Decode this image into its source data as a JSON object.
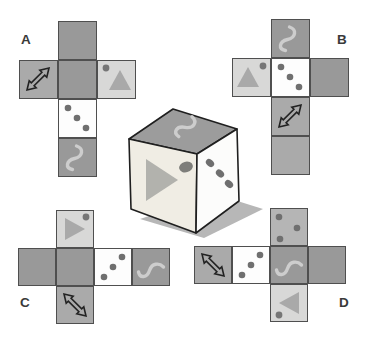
{
  "labels": {
    "option_a": "A",
    "option_b": "B",
    "option_c": "C",
    "option_d": "D"
  },
  "colors": {
    "background": "#ffffff",
    "border": "#4f4f4f",
    "dark": "#999999",
    "medium": "#aaaaaa",
    "light": "#d8d8d7",
    "lighter": "#b5b5b5",
    "white": "#fdfdfd",
    "dot": "#6f6f6f",
    "triangle": "#a9a9a9",
    "triangle_dot": "#767676",
    "squiggle": "#cdcdcd",
    "arrow_stroke": "#222222",
    "label_text": "#3a3a3a",
    "cube_top": "#9c9c9c",
    "cube_front": "#f0ede4",
    "cube_right": "#fcfcfb",
    "cube_stroke": "#1f1f1f",
    "cube_triangle": "#b2b2ad",
    "cube_front_dot": "#7e7e7a",
    "cube_right_dot": "#6f6f6f",
    "shadow": "#b7b7b7"
  },
  "nets": [
    {
      "id": "A",
      "label": "A",
      "label_pos": [
        21,
        33
      ],
      "origin": [
        19,
        21
      ],
      "cell": 39,
      "squares": [
        {
          "pos": [
            1,
            0
          ],
          "bg": "dark",
          "icon": "blank"
        },
        {
          "pos": [
            0,
            1
          ],
          "bg": "medium",
          "icon": "double-arrow-icon",
          "dir": "ne"
        },
        {
          "pos": [
            1,
            1
          ],
          "bg": "dark",
          "icon": "blank"
        },
        {
          "pos": [
            2,
            1
          ],
          "bg": "light",
          "icon": "triangle-icon",
          "tri": [
            [
              12,
              30
            ],
            [
              34,
              30
            ],
            [
              23,
              10
            ]
          ],
          "dot": [
            9,
            8
          ]
        },
        {
          "pos": [
            1,
            2
          ],
          "bg": "white",
          "icon": "three-dots-icon",
          "dots": [
            [
              10,
              9
            ],
            [
              19,
              19
            ],
            [
              28,
              29
            ]
          ]
        },
        {
          "pos": [
            1,
            3
          ],
          "bg": "dark",
          "icon": "s-curve-icon",
          "dir": "v"
        }
      ]
    },
    {
      "id": "B",
      "label": "B",
      "label_pos": [
        337,
        33
      ],
      "origin": [
        232,
        19
      ],
      "cell": 39,
      "squares": [
        {
          "pos": [
            1,
            0
          ],
          "bg": "dark",
          "icon": "s-curve-icon",
          "dir": "v"
        },
        {
          "pos": [
            0,
            1
          ],
          "bg": "light",
          "icon": "triangle-icon",
          "tri": [
            [
              5,
              29
            ],
            [
              27,
              29
            ],
            [
              16,
              9
            ]
          ],
          "dot": [
            31,
            8
          ]
        },
        {
          "pos": [
            1,
            1
          ],
          "bg": "white",
          "icon": "three-dots-icon",
          "dots": [
            [
              10,
              9
            ],
            [
              19,
              19
            ],
            [
              28,
              29
            ]
          ]
        },
        {
          "pos": [
            2,
            1
          ],
          "bg": "dark",
          "icon": "blank"
        },
        {
          "pos": [
            1,
            2
          ],
          "bg": "medium",
          "icon": "double-arrow-icon",
          "dir": "ne"
        },
        {
          "pos": [
            1,
            3
          ],
          "bg": "medium",
          "icon": "blank"
        }
      ]
    },
    {
      "id": "C",
      "label": "C",
      "label_pos": [
        20,
        296
      ],
      "origin": [
        18,
        210
      ],
      "cell": 38,
      "squares": [
        {
          "pos": [
            1,
            0
          ],
          "bg": "light",
          "icon": "triangle-icon",
          "tri": [
            [
              9,
              8
            ],
            [
              9,
              30
            ],
            [
              29,
              19
            ]
          ],
          "dot": [
            30,
            7
          ]
        },
        {
          "pos": [
            0,
            1
          ],
          "bg": "dark",
          "icon": "blank"
        },
        {
          "pos": [
            1,
            1
          ],
          "bg": "dark",
          "icon": "blank"
        },
        {
          "pos": [
            2,
            1
          ],
          "bg": "white",
          "icon": "three-dots-icon",
          "dots": [
            [
              10,
              29
            ],
            [
              19,
              19
            ],
            [
              28,
              9
            ]
          ]
        },
        {
          "pos": [
            3,
            1
          ],
          "bg": "dark",
          "icon": "s-curve-icon",
          "dir": "h"
        },
        {
          "pos": [
            1,
            2
          ],
          "bg": "medium",
          "icon": "double-arrow-icon",
          "dir": "nw"
        }
      ]
    },
    {
      "id": "D",
      "label": "D",
      "label_pos": [
        339,
        296
      ],
      "origin": [
        194,
        208
      ],
      "cell": 38,
      "squares": [
        {
          "pos": [
            2,
            0
          ],
          "bg": "lighter",
          "icon": "three-dots-icon",
          "dots": [
            [
              9,
              9
            ],
            [
              27,
              20
            ],
            [
              10,
              31
            ]
          ]
        },
        {
          "pos": [
            0,
            1
          ],
          "bg": "medium",
          "icon": "double-arrow-icon",
          "dir": "nw"
        },
        {
          "pos": [
            1,
            1
          ],
          "bg": "white",
          "icon": "three-dots-icon",
          "dots": [
            [
              10,
              29
            ],
            [
              19,
              19
            ],
            [
              28,
              9
            ]
          ]
        },
        {
          "pos": [
            2,
            1
          ],
          "bg": "dark",
          "icon": "s-curve-icon",
          "dir": "h"
        },
        {
          "pos": [
            3,
            1
          ],
          "bg": "dark",
          "icon": "blank"
        },
        {
          "pos": [
            2,
            2
          ],
          "bg": "light",
          "icon": "triangle-icon",
          "tri": [
            [
              29,
              8
            ],
            [
              29,
              30
            ],
            [
              9,
              19
            ]
          ],
          "dot": [
            9,
            31
          ]
        }
      ]
    }
  ],
  "cube": {
    "shadow": [
      [
        140,
        219
      ],
      [
        204,
        238
      ],
      [
        263,
        209
      ],
      [
        215,
        194
      ]
    ],
    "faces": [
      {
        "name": "top",
        "fill": "cube_top",
        "points": [
          [
            173,
            109
          ],
          [
            237,
            129
          ],
          [
            197,
            154
          ],
          [
            129,
            139
          ]
        ]
      },
      {
        "name": "front",
        "fill": "cube_front",
        "points": [
          [
            129,
            139
          ],
          [
            197,
            154
          ],
          [
            196,
            233
          ],
          [
            131,
            209
          ]
        ]
      },
      {
        "name": "right",
        "fill": "cube_right",
        "points": [
          [
            197,
            154
          ],
          [
            237,
            129
          ],
          [
            239,
            201
          ],
          [
            196,
            233
          ]
        ]
      }
    ],
    "top_icon": {
      "type": "s-curve-icon",
      "cx": 188,
      "cy": 127,
      "rot": 24,
      "scale": 1.0
    },
    "front_triangle": [
      [
        146,
        159
      ],
      [
        146,
        201
      ],
      [
        178,
        180
      ]
    ],
    "front_dot": {
      "cx": 186,
      "cy": 167,
      "rx": 7,
      "ry": 5.3,
      "rot": -15
    },
    "right_dots": [
      {
        "cx": 210,
        "cy": 163,
        "rx": 4.6,
        "ry": 3.4,
        "rot": 42
      },
      {
        "cx": 220,
        "cy": 173.5,
        "rx": 4.6,
        "ry": 3.4,
        "rot": 42
      },
      {
        "cx": 229,
        "cy": 184,
        "rx": 4.6,
        "ry": 3.4,
        "rot": 42
      }
    ]
  }
}
